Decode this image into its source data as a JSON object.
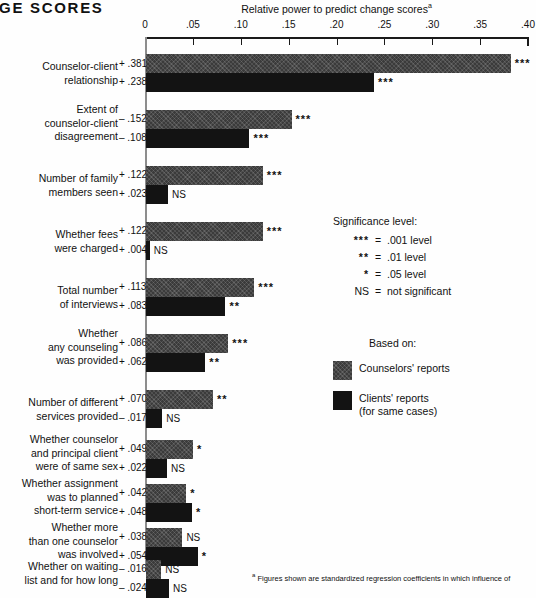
{
  "figure": {
    "title": "ANGE SCORES",
    "axis_title": "Relative power to predict change scores",
    "axis_title_footnote_marker": "a",
    "footnote_marker": "a",
    "footnote_text": "Figures shown are standardized regression coefficients in which influence of"
  },
  "chart_data": {
    "type": "bar",
    "orientation": "horizontal",
    "title": "ANGE SCORES",
    "xlabel": "Relative power to predict change scores",
    "ylabel": "",
    "xlim": [
      0,
      0.4
    ],
    "xticks": [
      0,
      0.05,
      0.1,
      0.15,
      0.2,
      0.25,
      0.3,
      0.35,
      0.4
    ],
    "xticklabels": [
      "0",
      ".05",
      ".10",
      ".15",
      ".20",
      ".25",
      ".30",
      ".35",
      ".40"
    ],
    "grid": false,
    "legend_position": "right",
    "series": [
      {
        "name": "Counselors' reports",
        "color": "#3b3b3b"
      },
      {
        "name": "Clients' reports (for same cases)",
        "color": "#131313"
      }
    ],
    "categories": [
      "Counselor-client relationship",
      "Extent of counselor-client disagreement",
      "Number of family members seen",
      "Whether fees were charged",
      "Total number of interviews",
      "Whether any counseling was provided",
      "Number of different services provided",
      "Whether counselor and principal client were of same sex",
      "Whether assignment was to planned short-term service",
      "Whether more than one counselor was involved",
      "Whether on waiting list and for how long"
    ],
    "groups": [
      {
        "label": "Counselor-client\nrelationship",
        "top": 54,
        "label_top": 60,
        "bars": [
          {
            "series": "Counselors' reports",
            "value_label": "+ .381",
            "value_sup": "a",
            "magnitude": 0.381,
            "sig": "***"
          },
          {
            "series": "Clients' reports",
            "value_label": "+ .238",
            "magnitude": 0.238,
            "sig": "***"
          }
        ]
      },
      {
        "label": "Extent of\ncounselor-client\ndisagreement",
        "top": 110,
        "label_top": 103,
        "bars": [
          {
            "series": "Counselors' reports",
            "value_label": "– .152",
            "magnitude": 0.152,
            "sig": "***"
          },
          {
            "series": "Clients' reports",
            "value_label": "– .108",
            "magnitude": 0.108,
            "sig": "***"
          }
        ]
      },
      {
        "label": "Number of family\nmembers seen",
        "top": 166,
        "label_top": 172,
        "bars": [
          {
            "series": "Counselors' reports",
            "value_label": "+ .122",
            "magnitude": 0.122,
            "sig": "***"
          },
          {
            "series": "Clients' reports",
            "value_label": "+ .023",
            "magnitude": 0.023,
            "sig": "NS"
          }
        ]
      },
      {
        "label": "Whether fees\nwere charged",
        "top": 222,
        "label_top": 228,
        "bars": [
          {
            "series": "Counselors' reports",
            "value_label": "+ .122",
            "magnitude": 0.122,
            "sig": "***"
          },
          {
            "series": "Clients' reports",
            "value_label": "+ .004",
            "magnitude": 0.004,
            "sig": "NS"
          }
        ]
      },
      {
        "label": "Total number\nof interviews",
        "top": 278,
        "label_top": 284,
        "bars": [
          {
            "series": "Counselors' reports",
            "value_label": "+ .113",
            "magnitude": 0.113,
            "sig": "***"
          },
          {
            "series": "Clients' reports",
            "value_label": "+ .083",
            "magnitude": 0.083,
            "sig": "**"
          }
        ]
      },
      {
        "label": "Whether\nany counseling\nwas provided",
        "top": 334,
        "label_top": 327,
        "bars": [
          {
            "series": "Counselors' reports",
            "value_label": "+ .086",
            "magnitude": 0.086,
            "sig": "***"
          },
          {
            "series": "Clients' reports",
            "value_label": "+ .062",
            "magnitude": 0.062,
            "sig": "**"
          }
        ]
      },
      {
        "label": "Number of different\nservices provided",
        "top": 390,
        "label_top": 396,
        "bars": [
          {
            "series": "Counselors' reports",
            "value_label": "+ .070",
            "magnitude": 0.07,
            "sig": "**"
          },
          {
            "series": "Clients' reports",
            "value_label": "– .017",
            "magnitude": 0.017,
            "sig": "NS"
          }
        ]
      },
      {
        "label": "Whether counselor\nand principal client\nwere of same sex",
        "top": 440,
        "label_top": 433,
        "bars": [
          {
            "series": "Counselors' reports",
            "value_label": "+ .049",
            "magnitude": 0.049,
            "sig": "*"
          },
          {
            "series": "Clients' reports",
            "value_label": "+ .022",
            "magnitude": 0.022,
            "sig": "NS"
          }
        ]
      },
      {
        "label": "Whether assignment\nwas to planned\nshort-term service",
        "top": 484,
        "label_top": 477,
        "bars": [
          {
            "series": "Counselors' reports",
            "value_label": "+ .042",
            "magnitude": 0.042,
            "sig": "*"
          },
          {
            "series": "Clients' reports",
            "value_label": "+ .048",
            "magnitude": 0.048,
            "sig": "*"
          }
        ]
      },
      {
        "label": "Whether more\nthan one counselor\nwas involved",
        "top": 528,
        "label_top": 521,
        "bars": [
          {
            "series": "Counselors' reports",
            "value_label": "+ .038",
            "magnitude": 0.038,
            "sig": "NS"
          },
          {
            "series": "Clients' reports",
            "value_label": "+ .054",
            "magnitude": 0.054,
            "sig": "*"
          }
        ]
      },
      {
        "label": "Whether on waiting\nlist and for how long",
        "top": 560,
        "label_top": 560,
        "bars": [
          {
            "series": "Counselors' reports",
            "value_label": "– .016",
            "magnitude": 0.016,
            "sig": "NS"
          },
          {
            "series": "Clients' reports",
            "value_label": "– .024",
            "magnitude": 0.024,
            "sig": "NS"
          }
        ]
      }
    ]
  },
  "significance_key": {
    "header": "Significance level:",
    "rows": [
      {
        "symbol": "***",
        "eq": "=",
        "text": ".001 level"
      },
      {
        "symbol": "**",
        "eq": "=",
        "text": ".01 level"
      },
      {
        "symbol": "*",
        "eq": "=",
        "text": ".05 level"
      },
      {
        "symbol": "NS",
        "eq": "=",
        "text": "not significant"
      }
    ]
  },
  "series_legend": {
    "header": "Based on:",
    "items": [
      {
        "label": "Counselors' reports",
        "swatch": "light"
      },
      {
        "label": "Clients' reports\n(for same cases)",
        "swatch": "dark"
      }
    ]
  }
}
